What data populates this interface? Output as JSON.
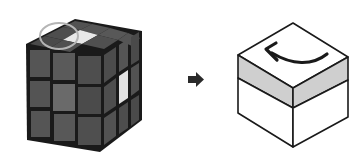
{
  "figure": {
    "left_cube": {
      "label": "3x3 cube photo with highlighted top-left piece",
      "highlight": "circle-marker",
      "colors": {
        "sticker_dark": "#4a4a4a",
        "sticker_mid": "#5e5e5e",
        "sticker_light": "#7a7a7a",
        "sticker_white": "#e6e6e6",
        "grid_line": "#151515",
        "circle": "#b0b0b0"
      }
    },
    "transition_arrow": {
      "icon": "right-arrow-icon",
      "color": "#2a2a2a"
    },
    "right_cube": {
      "label": "Schematic cube with top layer shaded",
      "rotation": "counter-clockwise",
      "colors": {
        "face": "#ffffff",
        "top_layer_band": "#cfcfcf",
        "outline": "#1a1a1a",
        "arrow": "#1a1a1a"
      }
    }
  }
}
